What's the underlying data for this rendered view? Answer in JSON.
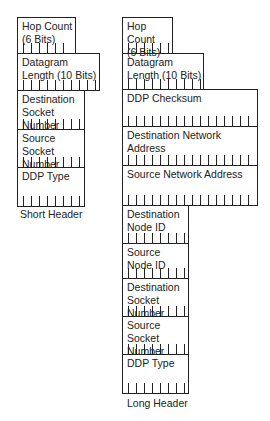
{
  "short_header": {
    "caption": "Short Header",
    "fields": [
      {
        "label": "Hop Count\n(6 Bits)",
        "bits": 6
      },
      {
        "label": "Datagram\nLength (10 Bits)",
        "bits": 10
      },
      {
        "label": "Destination\nSocket Number",
        "bits": 8
      },
      {
        "label": "Source\nSocket Number",
        "bits": 8
      },
      {
        "label": "DDP Type",
        "bits": 8
      }
    ]
  },
  "long_header": {
    "caption": "Long Header",
    "fields": [
      {
        "label": "Hop Count\n(6 Bits)",
        "bits": 6
      },
      {
        "label": "Datagram\nLength (10 Bits)",
        "bits": 10
      },
      {
        "label": "DDP Checksum",
        "bits": 16
      },
      {
        "label": "Destination Network Address",
        "bits": 16
      },
      {
        "label": "Source Network Address",
        "bits": 16
      },
      {
        "label": "Destination\nNode ID",
        "bits": 8
      },
      {
        "label": "Source\nNode ID",
        "bits": 8
      },
      {
        "label": "Destination\nSocket Number",
        "bits": 8
      },
      {
        "label": "Source Socket\nNumber",
        "bits": 8
      },
      {
        "label": "DDP Type",
        "bits": 8
      }
    ]
  }
}
